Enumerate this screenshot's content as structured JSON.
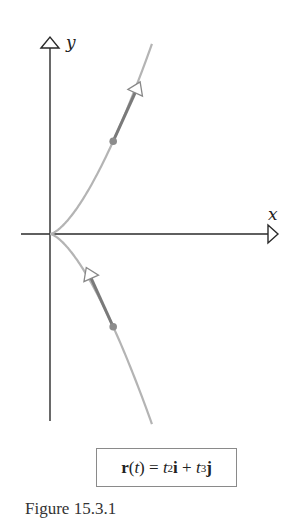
{
  "figure": {
    "caption": "Figure 15.3.1",
    "x_axis_label": "x",
    "y_axis_label": "y",
    "equation": {
      "lhs_bold": "r",
      "lhs_arg_open": "(",
      "lhs_arg": "t",
      "lhs_arg_close": ")",
      "equals": " = ",
      "term1_var": "t",
      "term1_exp": "2",
      "term1_unit": "i",
      "plus": " + ",
      "term2_var": "t",
      "term2_exp": "3",
      "term2_unit": "j"
    },
    "equation_text": "r(t) = t²i + t³j",
    "colors": {
      "axis": "#2a2a2a",
      "curve": "#b4b4b4",
      "tangent": "#7a7a7a",
      "point": "#8c8c8c",
      "box_border": "#8a8a8a"
    },
    "curve": {
      "type": "semicubical parabola (cusp at origin)",
      "parametric": "x = t^2, y = t^3",
      "t_range": [
        -1.27,
        1.27
      ],
      "marked_points": [
        {
          "t": 1,
          "position": [
            1,
            1
          ],
          "tangent": [
            2,
            3
          ]
        },
        {
          "t": -1,
          "position": [
            1,
            -1
          ],
          "tangent": [
            -2,
            3
          ]
        }
      ]
    }
  }
}
